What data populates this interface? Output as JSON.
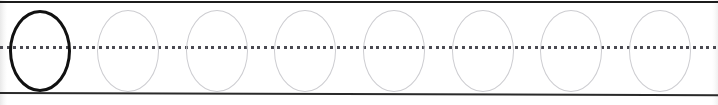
{
  "worksheet": {
    "kind": "handwriting-tracing-row",
    "letter": "O",
    "letter_case": "uppercase",
    "aria_label": "Letter O tracing practice row",
    "canvas": {
      "width": 718,
      "height": 105,
      "background": "#ffffff"
    },
    "rules": {
      "top_line": {
        "label": "top line",
        "y": 1,
        "color": "#1c1c1c",
        "style": "solid",
        "thickness": 2
      },
      "mid_line": {
        "label": "dotted midline",
        "y": 46,
        "color": "#4a4a52",
        "style": "dotted",
        "thickness": 3,
        "dot_size": 3,
        "dot_gap": 3.6
      },
      "bottom_line": {
        "label": "baseline",
        "y": 92,
        "color": "#2a2a2a",
        "style": "solid",
        "thickness": 2
      }
    },
    "glyph_geometry": {
      "width": 62,
      "height": 82,
      "top": 10,
      "corner_radius_x": 31,
      "corner_radius_y": 41,
      "pitch": 88.5,
      "first_left": 9
    },
    "glyphs": [
      {
        "index": 1,
        "char": "O",
        "role": "model",
        "state": "solid",
        "left": 9,
        "stroke_color": "#111111",
        "stroke_width": 3.2
      },
      {
        "index": 2,
        "char": "O",
        "role": "trace",
        "state": "guide",
        "left": 97,
        "stroke_color": "#cdcdd1",
        "stroke_width": 1.6
      },
      {
        "index": 3,
        "char": "O",
        "role": "trace",
        "state": "guide",
        "left": 186,
        "stroke_color": "#cdcdd1",
        "stroke_width": 1.6
      },
      {
        "index": 4,
        "char": "O",
        "role": "trace",
        "state": "guide",
        "left": 274,
        "stroke_color": "#cdcdd1",
        "stroke_width": 1.6
      },
      {
        "index": 5,
        "char": "O",
        "role": "trace",
        "state": "guide",
        "left": 363,
        "stroke_color": "#cdcdd1",
        "stroke_width": 1.6
      },
      {
        "index": 6,
        "char": "O",
        "role": "trace",
        "state": "guide",
        "left": 452,
        "stroke_color": "#cdcdd1",
        "stroke_width": 1.6
      },
      {
        "index": 7,
        "char": "O",
        "role": "trace",
        "state": "guide",
        "left": 540,
        "stroke_color": "#cdcdd1",
        "stroke_width": 1.6
      },
      {
        "index": 8,
        "char": "O",
        "role": "trace",
        "state": "guide",
        "left": 629,
        "stroke_color": "#cdcdd1",
        "stroke_width": 1.6
      }
    ],
    "glyph_count": 8,
    "model_count": 1,
    "trace_count": 7
  }
}
